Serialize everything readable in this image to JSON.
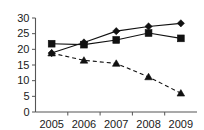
{
  "chart_data": {
    "type": "line",
    "title": "",
    "subtitle": "",
    "xlabel": "",
    "ylabel": "",
    "categories": [
      "2005",
      "2006",
      "2007",
      "2008",
      "2009"
    ],
    "x_tick_labels": [
      "2005",
      "2006",
      "2007",
      "2008",
      "2009"
    ],
    "y_tick_labels": [
      "0",
      "5",
      "10",
      "15",
      "20",
      "25",
      "30"
    ],
    "y_ticks": [
      0,
      5,
      10,
      15,
      20,
      25,
      30
    ],
    "ylim": [
      0,
      30
    ],
    "grid": false,
    "legend": "none",
    "legend_position": "none",
    "annotations": [],
    "series": [
      {
        "name": "series-diamond",
        "marker": "diamond",
        "line_style": "solid",
        "color": "#111111",
        "values": [
          18.8,
          22.2,
          25.8,
          27.3,
          28.3
        ]
      },
      {
        "name": "series-square",
        "marker": "square",
        "line_style": "solid",
        "color": "#111111",
        "values": [
          21.8,
          21.5,
          23.0,
          25.2,
          23.5
        ]
      },
      {
        "name": "series-triangle",
        "marker": "triangle",
        "line_style": "dashed",
        "color": "#111111",
        "values": [
          18.8,
          16.5,
          15.5,
          11.2,
          6.0
        ]
      }
    ]
  },
  "axis": {
    "color": "#555555"
  }
}
